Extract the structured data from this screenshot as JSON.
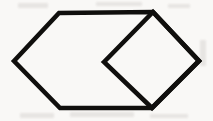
{
  "figure": {
    "type": "line-drawing",
    "canvas": {
      "width": 213,
      "height": 121
    },
    "style": {
      "background_color": "#f9f8f6",
      "stroke_color": "#100f0d",
      "stroke_width": 4.6,
      "fill": "none",
      "line_join": "miter",
      "line_cap": "butt"
    },
    "shapes": [
      {
        "name": "hexagon",
        "kind": "polygon",
        "closed": true,
        "points": "14,61 59,13 153,12 199,61 152,108 60,108",
        "vertices": [
          {
            "label": "left-apex",
            "x": 14,
            "y": 61
          },
          {
            "label": "top-left",
            "x": 59,
            "y": 13
          },
          {
            "label": "top-right",
            "x": 153,
            "y": 12
          },
          {
            "label": "right-apex",
            "x": 199,
            "y": 61
          },
          {
            "label": "bottom-right",
            "x": 152,
            "y": 108
          },
          {
            "label": "bottom-left",
            "x": 60,
            "y": 108
          }
        ]
      },
      {
        "name": "inner-square",
        "kind": "polygon",
        "closed": true,
        "points": "104,62 153,12 199,61 152,108",
        "vertices": [
          {
            "label": "square-left",
            "x": 104,
            "y": 62
          },
          {
            "label": "square-top",
            "x": 153,
            "y": 12
          },
          {
            "label": "square-right",
            "x": 199,
            "y": 61
          },
          {
            "label": "square-bottom",
            "x": 152,
            "y": 108
          }
        ]
      }
    ],
    "artifacts": [
      {
        "name": "smudge-top-left",
        "x": 18,
        "y": 3,
        "width": 30,
        "height": 5
      },
      {
        "name": "smudge-top-mid",
        "x": 96,
        "y": 2,
        "width": 46,
        "height": 4
      },
      {
        "name": "smudge-top-right",
        "x": 168,
        "y": 4,
        "width": 22,
        "height": 4
      },
      {
        "name": "smudge-bottom-left",
        "x": 20,
        "y": 113,
        "width": 34,
        "height": 5
      },
      {
        "name": "smudge-bottom-mid",
        "x": 70,
        "y": 112,
        "width": 64,
        "height": 5
      },
      {
        "name": "smudge-bottom-right",
        "x": 150,
        "y": 114,
        "width": 38,
        "height": 4
      },
      {
        "name": "smudge-right-edge",
        "x": 200,
        "y": 40,
        "width": 6,
        "height": 26
      }
    ]
  }
}
